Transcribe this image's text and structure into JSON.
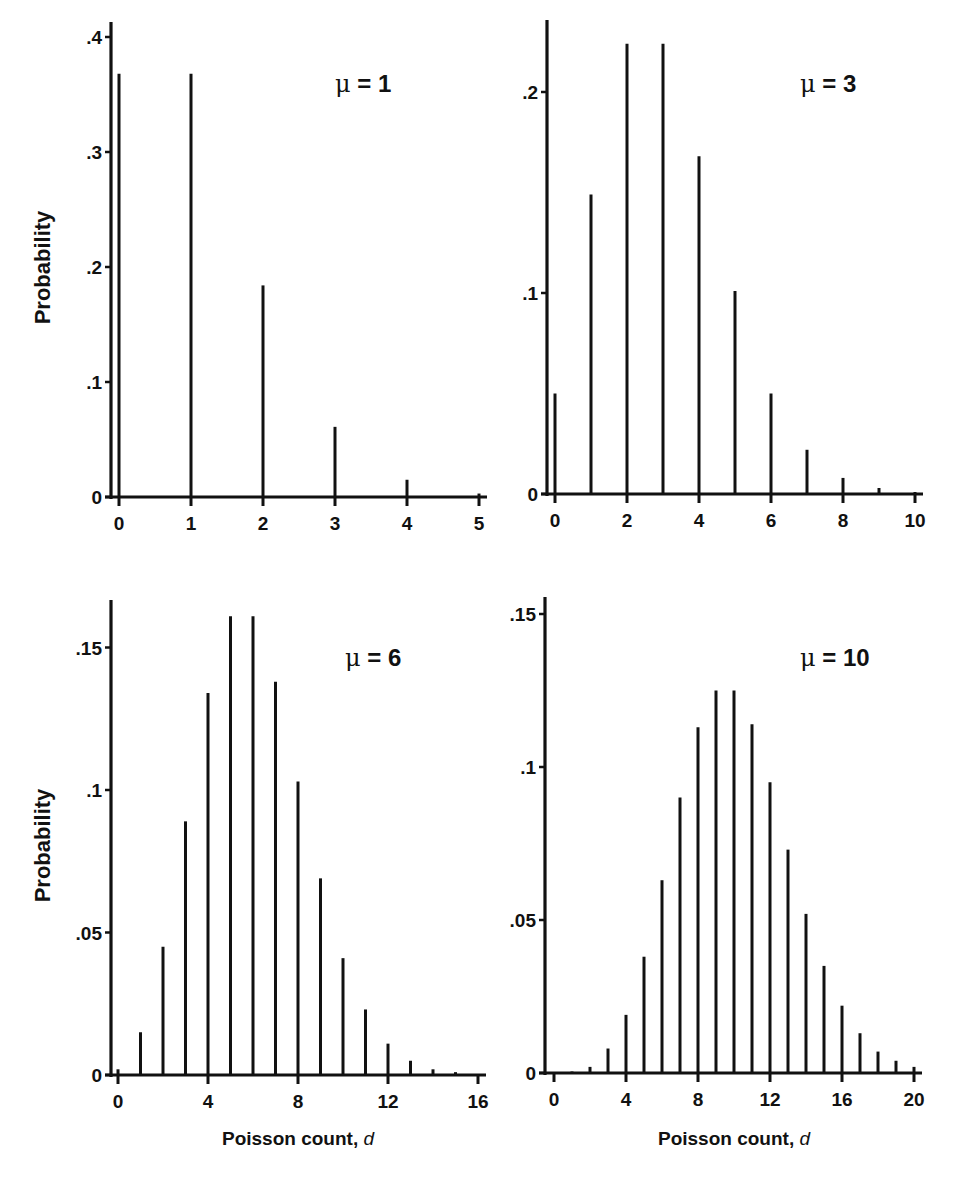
{
  "figure": {
    "ylabel": "Probability",
    "xlabel_text": "Poisson count, ",
    "xlabel_var": "d"
  },
  "chart_data": [
    {
      "type": "bar",
      "title": "μ = 1",
      "mu": 1,
      "xlabel": "",
      "ylabel": "Probability",
      "x": [
        0,
        1,
        2,
        3,
        4,
        5
      ],
      "values": [
        0.368,
        0.368,
        0.184,
        0.061,
        0.015,
        0.003
      ],
      "xticks": [
        "0",
        "1",
        "2",
        "3",
        "4",
        "5"
      ],
      "yticks": [
        "0",
        ".1",
        ".2",
        ".3",
        ".4"
      ],
      "ytick_values": [
        0,
        0.1,
        0.2,
        0.3,
        0.4
      ],
      "xlim": [
        0,
        5
      ],
      "ylim": [
        0,
        0.41
      ],
      "grid": false
    },
    {
      "type": "bar",
      "title": "μ = 3",
      "mu": 3,
      "xlabel": "",
      "ylabel": "",
      "x": [
        0,
        1,
        2,
        3,
        4,
        5,
        6,
        7,
        8,
        9,
        10
      ],
      "values": [
        0.05,
        0.149,
        0.224,
        0.224,
        0.168,
        0.101,
        0.05,
        0.022,
        0.008,
        0.003,
        0.001
      ],
      "xticks": [
        "0",
        "2",
        "4",
        "6",
        "8",
        "10"
      ],
      "yticks": [
        "0",
        ".1",
        ".2"
      ],
      "ytick_values": [
        0,
        0.1,
        0.2
      ],
      "xlim": [
        0,
        10
      ],
      "ylim": [
        0,
        0.235
      ],
      "grid": false
    },
    {
      "type": "bar",
      "title": "μ = 6",
      "mu": 6,
      "xlabel": "Poisson count, d",
      "ylabel": "Probability",
      "x": [
        0,
        1,
        2,
        3,
        4,
        5,
        6,
        7,
        8,
        9,
        10,
        11,
        12,
        13,
        14,
        15,
        16
      ],
      "values": [
        0.002,
        0.015,
        0.045,
        0.089,
        0.134,
        0.161,
        0.161,
        0.138,
        0.103,
        0.069,
        0.041,
        0.023,
        0.011,
        0.005,
        0.002,
        0.001,
        0.0
      ],
      "xticks": [
        "0",
        "4",
        "8",
        "12",
        "16"
      ],
      "yticks": [
        "0",
        ".05",
        ".1",
        ".15"
      ],
      "ytick_values": [
        0,
        0.05,
        0.1,
        0.15
      ],
      "xlim": [
        0,
        16
      ],
      "ylim": [
        0,
        0.165
      ],
      "grid": false
    },
    {
      "type": "bar",
      "title": "μ = 10",
      "mu": 10,
      "xlabel": "Poisson count, d",
      "ylabel": "",
      "x": [
        0,
        1,
        2,
        3,
        4,
        5,
        6,
        7,
        8,
        9,
        10,
        11,
        12,
        13,
        14,
        15,
        16,
        17,
        18,
        19,
        20
      ],
      "values": [
        0.0,
        0.0005,
        0.002,
        0.008,
        0.019,
        0.038,
        0.063,
        0.09,
        0.113,
        0.125,
        0.125,
        0.114,
        0.095,
        0.073,
        0.052,
        0.035,
        0.022,
        0.013,
        0.007,
        0.004,
        0.002
      ],
      "xticks": [
        "0",
        "4",
        "8",
        "12",
        "16",
        "20"
      ],
      "yticks": [
        "0",
        ".05",
        ".1",
        ".15"
      ],
      "ytick_values": [
        0,
        0.05,
        0.1,
        0.15
      ],
      "xlim": [
        0,
        20
      ],
      "ylim": [
        0,
        0.155
      ],
      "grid": false
    }
  ],
  "layout": {
    "panels": [
      {
        "axis_x": 111,
        "zero_y": 497,
        "top_y": 22,
        "px_per_unit_y": 1150,
        "x0": 119,
        "x_step": 72,
        "x_end": 479,
        "xtick_step": 1,
        "mu_x": 335,
        "mu_y": 92,
        "ylabel": true,
        "xlabel": false
      },
      {
        "axis_x": 547,
        "zero_y": 494,
        "top_y": 20,
        "px_per_unit_y": 2010,
        "x0": 555,
        "x_step": 36,
        "x_end": 915,
        "xtick_step": 2,
        "mu_x": 800,
        "mu_y": 92,
        "ylabel": false,
        "xlabel": false
      },
      {
        "axis_x": 111,
        "zero_y": 1075,
        "top_y": 600,
        "px_per_unit_y": 2850,
        "x0": 118,
        "x_step": 22.5,
        "x_end": 478,
        "xtick_step": 4,
        "mu_x": 345,
        "mu_y": 666,
        "ylabel": true,
        "xlabel": true
      },
      {
        "axis_x": 545,
        "zero_y": 1073,
        "top_y": 597,
        "px_per_unit_y": 3060,
        "x0": 554,
        "x_step": 18,
        "x_end": 914,
        "xtick_step": 4,
        "mu_x": 800,
        "mu_y": 666,
        "ylabel": false,
        "xlabel": true
      }
    ]
  }
}
